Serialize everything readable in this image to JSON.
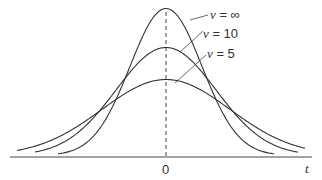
{
  "chart_data": {
    "type": "line",
    "title": "",
    "xlabel": "t",
    "ylabel": "",
    "x_ticks": [
      "0"
    ],
    "grid": false,
    "legend_position": "inline-annotations",
    "annotations": [
      {
        "text": "v = ∞",
        "points_to": "v=inf curve"
      },
      {
        "text": "v = 10",
        "points_to": "v=10 curve"
      },
      {
        "text": "v = 5",
        "points_to": "v=5 curve"
      }
    ],
    "series": [
      {
        "name": "v = ∞",
        "relative_peak": 1.0,
        "relative_width": 0.55
      },
      {
        "name": "v = 10",
        "relative_peak": 0.73,
        "relative_width": 0.78
      },
      {
        "name": "v = 5",
        "relative_peak": 0.51,
        "relative_width": 1.0
      }
    ],
    "center_line": {
      "x": 0,
      "style": "dashed"
    }
  },
  "labels": {
    "inf": {
      "var": "v",
      "rest": " = ∞"
    },
    "ten": {
      "var": "v",
      "rest": " = 10"
    },
    "five": {
      "var": "v",
      "rest": " = 5"
    },
    "zero": "0",
    "t": "t"
  }
}
